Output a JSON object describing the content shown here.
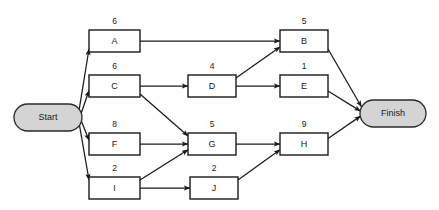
{
  "diagram": {
    "type": "activity-on-node network",
    "background_color": "#fefefe",
    "node_fill": "#ffffff",
    "node_stroke": "#1a1a1a",
    "terminal_fill": "#d4d4d4",
    "terminal_stroke": "#2b2b2b",
    "edge_color": "#1a1a1a"
  },
  "terminals": [
    {
      "id": "start",
      "label": "Start",
      "x": 14,
      "y": 104,
      "w": 68,
      "h": 27
    },
    {
      "id": "finish",
      "label": "Finish",
      "x": 360,
      "y": 100,
      "w": 66,
      "h": 27
    }
  ],
  "nodes": [
    {
      "id": "A",
      "label": "A",
      "duration": "6",
      "x": 89,
      "y": 30,
      "w": 51,
      "h": 22
    },
    {
      "id": "C",
      "label": "C",
      "duration": "6",
      "x": 89,
      "y": 75,
      "w": 51,
      "h": 22
    },
    {
      "id": "F",
      "label": "F",
      "duration": "8",
      "x": 89,
      "y": 133,
      "w": 51,
      "h": 22
    },
    {
      "id": "I",
      "label": "I",
      "duration": "2",
      "x": 89,
      "y": 177,
      "w": 51,
      "h": 22
    },
    {
      "id": "D",
      "label": "D",
      "duration": "4",
      "x": 188,
      "y": 75,
      "w": 48,
      "h": 22
    },
    {
      "id": "G",
      "label": "G",
      "duration": "5",
      "x": 188,
      "y": 133,
      "w": 48,
      "h": 22
    },
    {
      "id": "J",
      "label": "J",
      "duration": "2",
      "x": 190,
      "y": 177,
      "w": 48,
      "h": 22
    },
    {
      "id": "B",
      "label": "B",
      "duration": "5",
      "x": 280,
      "y": 30,
      "w": 48,
      "h": 22
    },
    {
      "id": "E",
      "label": "E",
      "duration": "1",
      "x": 280,
      "y": 75,
      "w": 48,
      "h": 22
    },
    {
      "id": "H",
      "label": "H",
      "duration": "9",
      "x": 280,
      "y": 133,
      "w": 48,
      "h": 22
    }
  ],
  "edges": [
    {
      "from": "start",
      "to": "A"
    },
    {
      "from": "start",
      "to": "C"
    },
    {
      "from": "start",
      "to": "F"
    },
    {
      "from": "start",
      "to": "I"
    },
    {
      "from": "A",
      "to": "B"
    },
    {
      "from": "C",
      "to": "D"
    },
    {
      "from": "C",
      "to": "G"
    },
    {
      "from": "D",
      "to": "B"
    },
    {
      "from": "D",
      "to": "E"
    },
    {
      "from": "F",
      "to": "G"
    },
    {
      "from": "I",
      "to": "G"
    },
    {
      "from": "I",
      "to": "J"
    },
    {
      "from": "G",
      "to": "H"
    },
    {
      "from": "J",
      "to": "H"
    },
    {
      "from": "B",
      "to": "finish"
    },
    {
      "from": "E",
      "to": "finish"
    },
    {
      "from": "H",
      "to": "finish"
    }
  ]
}
